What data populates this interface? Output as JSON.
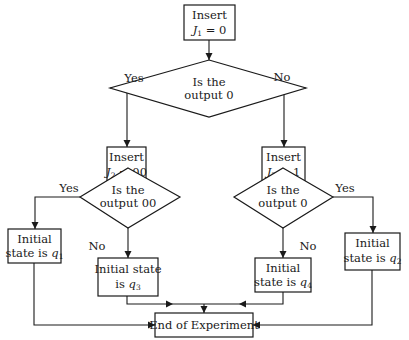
{
  "diagram": {
    "type": "flowchart",
    "nodes": {
      "insert_j1": {
        "line1": "Insert",
        "var": "J",
        "sub": "1",
        "rest": " = 0"
      },
      "decision_1": {
        "line1": "Is the",
        "line2": "output 0"
      },
      "insert_j2": {
        "line1": "Insert",
        "var": "J",
        "sub": "2",
        "rest": " = 00"
      },
      "insert_j3": {
        "line1": "Insert",
        "var": "J",
        "sub": "3",
        "rest": " = 1"
      },
      "decision_2": {
        "line1": "Is the",
        "line2": "output 00"
      },
      "decision_3": {
        "line1": "Is the",
        "line2": "output 0"
      },
      "state_q1": {
        "line1": "Initial",
        "line2": "state is ",
        "var": "q",
        "sub": "1"
      },
      "state_q3": {
        "line1": "Initial state",
        "line2": "is ",
        "var": "q",
        "sub": "3"
      },
      "state_q4": {
        "line1": "Initial",
        "line2": "state is ",
        "var": "q",
        "sub": "4"
      },
      "state_q2": {
        "line1": "Initial",
        "line2": "state is ",
        "var": "q",
        "sub": "2"
      },
      "end": {
        "label": "End of Experiment"
      }
    },
    "edge_labels": {
      "d1_yes": "Yes",
      "d1_no": "No",
      "d2_yes": "Yes",
      "d2_no": "No",
      "d3_yes": "Yes",
      "d3_no": "No"
    },
    "edges": [
      {
        "from": "insert_j1",
        "to": "decision_1"
      },
      {
        "from": "decision_1",
        "to": "insert_j2",
        "label": "Yes"
      },
      {
        "from": "decision_1",
        "to": "insert_j3",
        "label": "No"
      },
      {
        "from": "insert_j2",
        "to": "decision_2"
      },
      {
        "from": "insert_j3",
        "to": "decision_3"
      },
      {
        "from": "decision_2",
        "to": "state_q1",
        "label": "Yes"
      },
      {
        "from": "decision_2",
        "to": "state_q3",
        "label": "No"
      },
      {
        "from": "decision_3",
        "to": "state_q2",
        "label": "Yes"
      },
      {
        "from": "decision_3",
        "to": "state_q4",
        "label": "No"
      },
      {
        "from": "state_q1",
        "to": "end"
      },
      {
        "from": "state_q3",
        "to": "end"
      },
      {
        "from": "state_q4",
        "to": "end"
      },
      {
        "from": "state_q2",
        "to": "end"
      }
    ]
  }
}
